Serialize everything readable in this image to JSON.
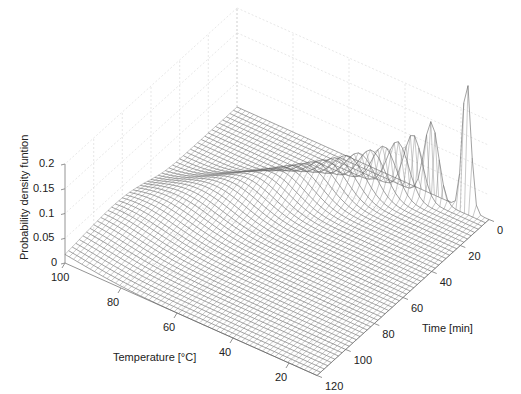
{
  "chart_data": {
    "type": "surface",
    "title": "",
    "xlabel": "Temperature [°C]",
    "ylabel": "Time [min]",
    "zlabel": "Probability density funtion",
    "x_ticks": [
      "100",
      "80",
      "60",
      "40",
      "20"
    ],
    "x_tick_values": [
      100,
      80,
      60,
      40,
      20
    ],
    "y_ticks": [
      "0",
      "20",
      "40",
      "60",
      "80",
      "100",
      "120"
    ],
    "y_tick_values": [
      0,
      20,
      40,
      60,
      80,
      100,
      120
    ],
    "z_ticks": [
      "0",
      "0.05",
      "0.1",
      "0.15",
      "0.2"
    ],
    "z_tick_values": [
      0,
      0.05,
      0.1,
      0.15,
      0.2
    ],
    "xlim": [
      10,
      100
    ],
    "ylim": [
      0,
      120
    ],
    "zlim": [
      0,
      0.2
    ],
    "grid": true,
    "mesh_color": "#555555"
  }
}
